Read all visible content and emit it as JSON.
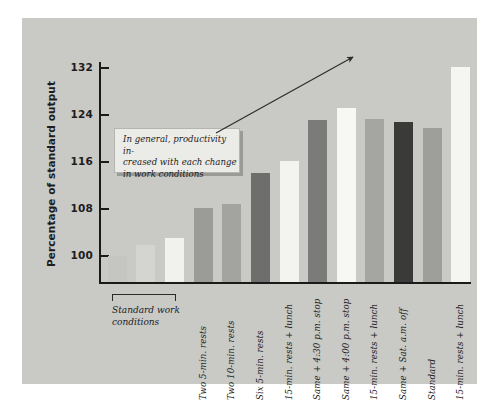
{
  "chart_data": {
    "type": "bar",
    "title": "",
    "xlabel": "",
    "ylabel": "Percentage of standard output",
    "ylim": [
      95.6,
      136.0
    ],
    "yticks": [
      100,
      108,
      116,
      124,
      132
    ],
    "ytick_labels": [
      "100",
      "108",
      "116",
      "124",
      "132"
    ],
    "grid": false,
    "legend": null,
    "categories": [
      "",
      "",
      "",
      "Two 5-min. rests",
      "Two 10-min. rests",
      "Six 5-min. rests",
      "15-min. rests + lunch",
      "Same + 4:30 p.m. stop",
      "Same + 4:00 p.m. stop",
      "15-min. rests + lunch",
      "Same + Sat. a.m. off",
      "Standard",
      "15-min. rests + lunch"
    ],
    "values": [
      100.0,
      101.8,
      103.0,
      108.2,
      108.8,
      114.2,
      116.2,
      123.2,
      125.2,
      123.4,
      122.8,
      121.8,
      132.2
    ],
    "bar_colors": [
      "#c5c5c2",
      "#d4d4d1",
      "#f1f1ee",
      "#9b9b98",
      "#a3a3a0",
      "#6e6e6c",
      "#f3f3f0",
      "#7b7b79",
      "#f7f7f4",
      "#a5a5a2",
      "#3a3a39",
      "#9e9e9b",
      "#f5f5f2"
    ],
    "annotations": [
      {
        "id": "callout",
        "text": "In general, productivity increased with each change in work conditions",
        "lines": [
          "In general, productivity in-",
          "creased with each change",
          "in work conditions"
        ]
      },
      {
        "id": "group-bracket",
        "lines": [
          "Standard work",
          "conditions"
        ],
        "covers": [
          0,
          1,
          2
        ]
      },
      {
        "id": "trend-arrow",
        "kind": "arrow",
        "direction": "up-right",
        "from": [
          216,
          133
        ],
        "to": [
          353,
          57
        ]
      }
    ]
  },
  "colors": {
    "panel_background": "#c9c9c6",
    "axis": "#1a1a1a",
    "callout_fill": "#ebebe8",
    "callout_shadow": "#9a9a97",
    "text": "#1c1c1c",
    "arrow": "#2a2a2a"
  }
}
